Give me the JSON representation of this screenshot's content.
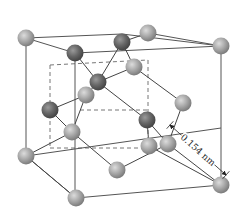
{
  "diagram": {
    "colors": {
      "light_atom": "#a8a8a8",
      "light_atom_highlight": "#d9d9d9",
      "dark_atom": "#6a6a6a",
      "dark_atom_highlight": "#9a9a9a",
      "edge": "#555555",
      "background": "#ffffff"
    },
    "outer_cube": {
      "vertices": {
        "top_front_left": [
          26,
          38
        ],
        "top_back_right": [
          150,
          32
        ],
        "top_front_right": [
          221,
          59
        ],
        "top_back_left": [
          98,
          32
        ],
        "bottom_front_left": [
          26,
          157
        ],
        "bottom_front_mid": [
          76,
          198
        ],
        "bottom_front_right": [
          221,
          185
        ],
        "bottom_back_right": [
          167,
          145
        ]
      }
    },
    "dashed_inner_cube": {
      "note": "hidden edges of inner tetrahedral sub-cube"
    },
    "atoms": [
      {
        "id": "a1",
        "type": "light",
        "x": 26,
        "y": 38
      },
      {
        "id": "a2",
        "type": "light",
        "x": 148,
        "y": 33
      },
      {
        "id": "a3",
        "type": "light",
        "x": 221,
        "y": 46
      },
      {
        "id": "a4",
        "type": "light",
        "x": 134,
        "y": 67
      },
      {
        "id": "a5",
        "type": "light",
        "x": 183,
        "y": 103
      },
      {
        "id": "a6",
        "type": "light",
        "x": 86,
        "y": 95
      },
      {
        "id": "a7",
        "type": "light",
        "x": 72,
        "y": 132
      },
      {
        "id": "a8",
        "type": "light",
        "x": 26,
        "y": 156
      },
      {
        "id": "a9",
        "type": "light",
        "x": 117,
        "y": 170
      },
      {
        "id": "a10",
        "type": "light",
        "x": 149,
        "y": 146
      },
      {
        "id": "a11",
        "type": "light",
        "x": 168,
        "y": 144
      },
      {
        "id": "a12",
        "type": "light",
        "x": 76,
        "y": 198
      },
      {
        "id": "a13",
        "type": "light",
        "x": 221,
        "y": 185
      },
      {
        "id": "d1",
        "type": "dark",
        "x": 75,
        "y": 53
      },
      {
        "id": "d2",
        "type": "dark",
        "x": 122,
        "y": 42
      },
      {
        "id": "d3",
        "type": "dark",
        "x": 98,
        "y": 82
      },
      {
        "id": "d4",
        "type": "dark",
        "x": 50,
        "y": 110
      },
      {
        "id": "d5",
        "type": "dark",
        "x": 147,
        "y": 120
      }
    ],
    "solid_edges": [
      [
        26,
        38,
        122,
        34
      ],
      [
        122,
        34,
        221,
        46
      ],
      [
        26,
        38,
        26,
        156
      ],
      [
        221,
        46,
        221,
        185
      ],
      [
        26,
        156,
        76,
        198
      ],
      [
        76,
        198,
        221,
        185
      ],
      [
        26,
        156,
        221,
        128
      ],
      [
        75,
        53,
        221,
        46
      ],
      [
        26,
        38,
        75,
        53
      ],
      [
        75,
        53,
        75,
        198
      ],
      [
        148,
        33,
        221,
        46
      ]
    ],
    "dashed_edges": [
      [
        50,
        65,
        148,
        60
      ],
      [
        50,
        65,
        50,
        148
      ],
      [
        148,
        60,
        148,
        150
      ],
      [
        50,
        148,
        148,
        148
      ],
      [
        80,
        110,
        148,
        110
      ]
    ],
    "bonds": [
      [
        75,
        53,
        98,
        82
      ],
      [
        122,
        42,
        98,
        82
      ],
      [
        98,
        82,
        86,
        95
      ],
      [
        98,
        82,
        134,
        67
      ],
      [
        134,
        67,
        183,
        103
      ],
      [
        98,
        82,
        147,
        120
      ],
      [
        147,
        120,
        149,
        146
      ],
      [
        147,
        120,
        168,
        144
      ],
      [
        183,
        103,
        168,
        144
      ],
      [
        50,
        110,
        72,
        132
      ],
      [
        50,
        110,
        86,
        95
      ],
      [
        86,
        95,
        72,
        132
      ],
      [
        72,
        132,
        26,
        156
      ],
      [
        72,
        132,
        117,
        170
      ],
      [
        26,
        156,
        76,
        198
      ],
      [
        117,
        170,
        168,
        144
      ],
      [
        168,
        144,
        221,
        185
      ],
      [
        149,
        146,
        221,
        185
      ],
      [
        122,
        42,
        148,
        33
      ],
      [
        122,
        42,
        134,
        67
      ]
    ],
    "dimension": {
      "label": "0.154 nm",
      "start": [
        170,
        125
      ],
      "end": [
        226,
        175
      ],
      "text_x": 178,
      "text_y": 138,
      "rotation": 42
    }
  }
}
